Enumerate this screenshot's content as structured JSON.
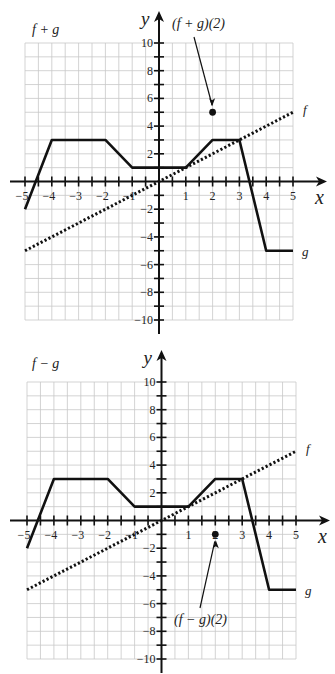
{
  "chart_data": [
    {
      "type": "line",
      "title": "f + g",
      "xlabel": "x",
      "ylabel": "y",
      "xlim": [
        -5,
        5
      ],
      "ylim": [
        -10,
        10
      ],
      "grid": true,
      "x_ticks": [
        -5,
        -4,
        -3,
        -2,
        -1,
        1,
        2,
        3,
        4,
        5
      ],
      "y_ticks": [
        -10,
        -8,
        -6,
        -4,
        -2,
        2,
        4,
        6,
        8,
        10
      ],
      "series": [
        {
          "name": "f",
          "style": "dotted",
          "x": [
            -5,
            5
          ],
          "y": [
            -5,
            5
          ]
        },
        {
          "name": "g",
          "style": "solid",
          "x": [
            -5,
            -4,
            -2,
            -1,
            1,
            2,
            3,
            4,
            5
          ],
          "y": [
            -2,
            3,
            3,
            1,
            1,
            3,
            3,
            -5,
            -5
          ]
        }
      ],
      "annotations": [
        {
          "text": "(f + g)(2)",
          "point": [
            2,
            5
          ]
        }
      ],
      "series_labels": {
        "f": "f",
        "g": "g"
      }
    },
    {
      "type": "line",
      "title": "f − g",
      "xlabel": "x",
      "ylabel": "y",
      "xlim": [
        -5,
        5
      ],
      "ylim": [
        -10,
        10
      ],
      "grid": true,
      "x_ticks": [
        -5,
        -4,
        -3,
        -2,
        -1,
        1,
        2,
        3,
        4,
        5
      ],
      "y_ticks": [
        -10,
        -8,
        -6,
        -4,
        -2,
        2,
        4,
        6,
        8,
        10
      ],
      "series": [
        {
          "name": "f",
          "style": "dotted",
          "x": [
            -5,
            5
          ],
          "y": [
            -5,
            5
          ]
        },
        {
          "name": "g",
          "style": "solid",
          "x": [
            -5,
            -4,
            -2,
            -1,
            1,
            2,
            3,
            4,
            5
          ],
          "y": [
            -2,
            3,
            3,
            1,
            1,
            3,
            3,
            -5,
            -5
          ]
        }
      ],
      "annotations": [
        {
          "text": "(f − g)(2)",
          "point": [
            2,
            -1
          ]
        }
      ],
      "series_labels": {
        "f": "f",
        "g": "g"
      }
    }
  ]
}
